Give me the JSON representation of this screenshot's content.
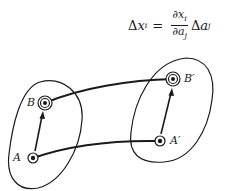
{
  "formula": {
    "lhs_delta": "Δ",
    "lhs_var": "x",
    "lhs_sub": "i",
    "equals": "=",
    "num_partial": "∂",
    "num_var": "x",
    "num_sub": "i",
    "den_partial": "∂",
    "den_var": "a",
    "den_sub": "j",
    "rhs_delta": "Δ",
    "rhs_var": "a",
    "rhs_sub": "j"
  },
  "points": {
    "A": {
      "label": "A",
      "x": 33,
      "y": 158
    },
    "B": {
      "label": "B",
      "x": 45,
      "y": 103
    },
    "A_prime": {
      "label": "A′",
      "x": 160,
      "y": 141
    },
    "B_prime": {
      "label": "B′",
      "x": 173,
      "y": 79
    }
  },
  "colors": {
    "ink": "#1a1a1a",
    "background": "#ffffff"
  }
}
